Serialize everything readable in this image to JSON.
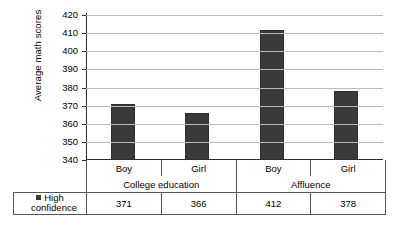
{
  "chart_data": {
    "type": "bar",
    "title": "",
    "xlabel": "",
    "ylabel": "Average math scores",
    "ylim": [
      340,
      420
    ],
    "ytick_step": 10,
    "yticks": [
      420,
      410,
      400,
      390,
      380,
      370,
      360,
      350,
      340
    ],
    "grid": true,
    "legend_position": "table-left",
    "categories": [
      "Boy",
      "Girl",
      "Boy",
      "Girl"
    ],
    "groups": [
      {
        "label": "College education",
        "span": 2
      },
      {
        "label": "Affluence",
        "span": 2
      }
    ],
    "series": [
      {
        "name": "High confidence",
        "color": "#3a3a3a",
        "values": [
          371,
          366,
          412,
          378
        ]
      }
    ]
  },
  "legend": {
    "line1": "High",
    "line2": "confidence",
    "swatch_color": "#3a3a3a"
  },
  "table": {
    "row_values": [
      "371",
      "366",
      "412",
      "378"
    ]
  }
}
